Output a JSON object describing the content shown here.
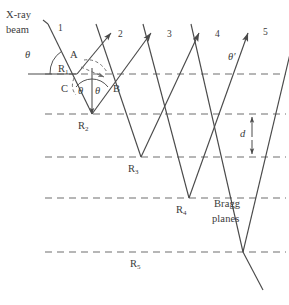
{
  "figure": {
    "stroke_color": "#4a4a4a",
    "text_color": "#3a3a3a",
    "background": "#ffffff",
    "width": 289,
    "height": 305
  },
  "labels": {
    "xray_line1": "X-ray",
    "xray_line2": "beam",
    "bragg_line1": "Bragg",
    "bragg_line2": "planes",
    "spacing": "d",
    "theta_incident": "θ",
    "theta_left": "θ",
    "theta_right": "θ",
    "theta_prime": "θ′",
    "point_A": "A",
    "point_B": "B",
    "point_C": "C"
  },
  "scattering_points": [
    {
      "name": "R1",
      "base": "R",
      "sub": "1"
    },
    {
      "name": "R2",
      "base": "R",
      "sub": "2"
    },
    {
      "name": "R3",
      "base": "R",
      "sub": "3"
    },
    {
      "name": "R4",
      "base": "R",
      "sub": "4"
    },
    {
      "name": "R5",
      "base": "R",
      "sub": "5"
    }
  ],
  "rays": [
    {
      "name": "ray-1",
      "label": "1"
    },
    {
      "name": "ray-2",
      "label": "2"
    },
    {
      "name": "ray-3",
      "label": "3"
    },
    {
      "name": "ray-4",
      "label": "4"
    },
    {
      "name": "ray-5",
      "label": "5"
    }
  ],
  "planes": {
    "count": 5,
    "style": "dashed",
    "y_positions": [
      74,
      114,
      157,
      198,
      252
    ]
  }
}
